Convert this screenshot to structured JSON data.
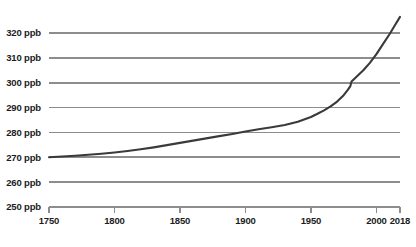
{
  "chart_data": {
    "type": "line",
    "title": "",
    "subtitle": "",
    "xlabel": "",
    "ylabel": "",
    "unit": "ppb",
    "grid": true,
    "legend": false,
    "legend_position": "none",
    "line_color": "#3a3a3a",
    "grid_color": "#8d8d8d",
    "axis_color": "#8d8d8d",
    "label_color": "#1c1c1c",
    "xlim": [
      1750,
      2018
    ],
    "ylim": [
      250,
      330
    ],
    "x_ticks": [
      1750,
      1800,
      1850,
      1900,
      1950,
      2000,
      2018
    ],
    "x_tick_labels": [
      "1750",
      "1800",
      "1850",
      "1900",
      "1950",
      "2000",
      "2018"
    ],
    "y_ticks": [
      250,
      260,
      270,
      280,
      290,
      300,
      310,
      320
    ],
    "y_tick_labels": [
      "250 ppb",
      "260 ppb",
      "270 ppb",
      "280 ppb",
      "290 ppb",
      "300 ppb",
      "310 ppb",
      "320 ppb"
    ],
    "series": [
      {
        "name": "Atmospheric concentration",
        "x": [
          1750,
          1760,
          1770,
          1780,
          1790,
          1800,
          1810,
          1820,
          1830,
          1840,
          1850,
          1860,
          1870,
          1880,
          1890,
          1900,
          1910,
          1920,
          1930,
          1940,
          1950,
          1955,
          1960,
          1965,
          1970,
          1975,
          1978,
          1980,
          1981,
          1985,
          1990,
          1995,
          2000,
          2005,
          2010,
          2014,
          2018
        ],
        "y": [
          270.0,
          270.3,
          270.6,
          271.0,
          271.4,
          271.9,
          272.5,
          273.2,
          274.0,
          274.9,
          275.8,
          276.7,
          277.6,
          278.5,
          279.4,
          280.4,
          281.3,
          282.1,
          283.0,
          284.3,
          286.2,
          287.5,
          288.9,
          290.5,
          292.4,
          295.0,
          297.0,
          298.5,
          300.5,
          302.5,
          305.0,
          308.0,
          311.5,
          315.5,
          319.5,
          323.0,
          326.5
        ]
      }
    ]
  }
}
